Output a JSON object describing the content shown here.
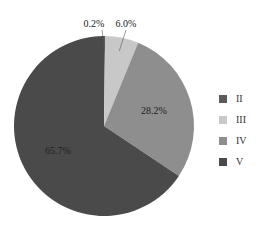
{
  "chart_data": {
    "type": "pie",
    "title": "",
    "categories": [
      "II",
      "III",
      "IV",
      "V"
    ],
    "values": [
      0.2,
      6.0,
      28.2,
      65.7
    ],
    "labels": [
      "0.2%",
      "6.0%",
      "28.2%",
      "65.7%"
    ],
    "colors": [
      "#5a5a5a",
      "#c8c8c8",
      "#8e8e8e",
      "#4a4a4a"
    ],
    "start_angle": "12 o'clock",
    "direction": "clockwise",
    "legend_position": "right"
  },
  "legend": {
    "items": [
      {
        "label": "II",
        "color": "#5a5a5a"
      },
      {
        "label": "III",
        "color": "#c8c8c8"
      },
      {
        "label": "IV",
        "color": "#8e8e8e"
      },
      {
        "label": "V",
        "color": "#4a4a4a"
      }
    ]
  }
}
